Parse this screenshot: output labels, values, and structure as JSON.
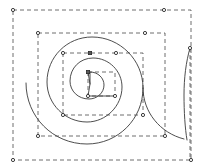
{
  "document": {
    "title": "Spiral selection",
    "canvas": {
      "width": 204,
      "height": 168,
      "background": "#ffffff"
    }
  },
  "style": {
    "path_stroke": "#3a3a3a",
    "path_stroke_width": 0.9,
    "guide_stroke": "#4a4a4a",
    "guide_stroke_width": 0.8,
    "guide_dash": "4,3",
    "handle_stroke": "#2b2b2b",
    "handle_fill": "#ffffff",
    "handle_fill_active": "#5a5a5a",
    "handle_size": 3.2
  },
  "shape": {
    "name": "archimedean-spiral",
    "turns": 3,
    "center": {
      "x": 90,
      "y": 84
    },
    "start_point": {
      "x": 90,
      "y": 84
    },
    "end_point": {
      "x": 190,
      "y": 48
    }
  },
  "bounding_boxes": [
    {
      "id": "bbox-outer",
      "x": 13,
      "y": 10,
      "width": 178,
      "height": 150
    },
    {
      "id": "bbox-second",
      "x": 38,
      "y": 33,
      "width": 127,
      "height": 103
    },
    {
      "id": "bbox-inner",
      "x": 63,
      "y": 53,
      "width": 80,
      "height": 62
    },
    {
      "id": "bbox-core",
      "x": 88,
      "y": 72,
      "width": 27,
      "height": 24
    }
  ],
  "handles": [
    {
      "name": "handle-outer-top-left",
      "x": 13,
      "y": 10,
      "type": "round"
    },
    {
      "name": "handle-outer-top-right",
      "x": 164,
      "y": 10,
      "type": "round"
    },
    {
      "name": "handle-outer-bottom-left",
      "x": 13,
      "y": 160,
      "type": "round"
    },
    {
      "name": "handle-outer-bottom-right",
      "x": 191,
      "y": 160,
      "type": "round"
    },
    {
      "name": "handle-second-top-left",
      "x": 38,
      "y": 33,
      "type": "round"
    },
    {
      "name": "handle-second-top-right",
      "x": 145,
      "y": 33,
      "type": "round"
    },
    {
      "name": "handle-second-bottom-left",
      "x": 38,
      "y": 136,
      "type": "round"
    },
    {
      "name": "handle-second-bottom-right",
      "x": 165,
      "y": 136,
      "type": "round"
    },
    {
      "name": "handle-inner-top-left",
      "x": 63,
      "y": 53,
      "type": "round"
    },
    {
      "name": "handle-inner-top-mid",
      "x": 90,
      "y": 53,
      "type": "square"
    },
    {
      "name": "handle-inner-top-right",
      "x": 116,
      "y": 53,
      "type": "round"
    },
    {
      "name": "handle-inner-bottom-left",
      "x": 63,
      "y": 115,
      "type": "round"
    },
    {
      "name": "handle-inner-bottom-right",
      "x": 143,
      "y": 115,
      "type": "round"
    },
    {
      "name": "handle-core-top-left",
      "x": 88,
      "y": 72,
      "type": "square"
    },
    {
      "name": "handle-core-bottom-left",
      "x": 88,
      "y": 96,
      "type": "round"
    },
    {
      "name": "handle-core-bottom-right",
      "x": 115,
      "y": 96,
      "type": "round"
    },
    {
      "name": "handle-spiral-end",
      "x": 190,
      "y": 48,
      "type": "round"
    }
  ],
  "guides": [
    {
      "name": "guide-spiral-end-vertical",
      "x1": 190,
      "y1": 48,
      "x2": 190,
      "y2": 160
    }
  ],
  "paths": {
    "spiral_outer": "M 90 84 L 90 72 C 98 72 104 78 104 85 C 104 93 97 99 89 99 C 78 99 70 91 70 81 C 70 68 80 58 93 58 C 109 58 122 71 122 87 C 122 106 106 122 87 122 C 65 122 47 104 47 82 C 47 57 67 37 92 37 C 120 37 143 60 143 88 C 143 119 118 144 87 144 C 53 144 26 117 26 83",
    "spiral_tail": "M 143 88 C 143 112 160 133 184 139",
    "spiral_lead": "M 190 48 C 186 62 184 78 184 95 C 184 112 185 128 187 140"
  }
}
